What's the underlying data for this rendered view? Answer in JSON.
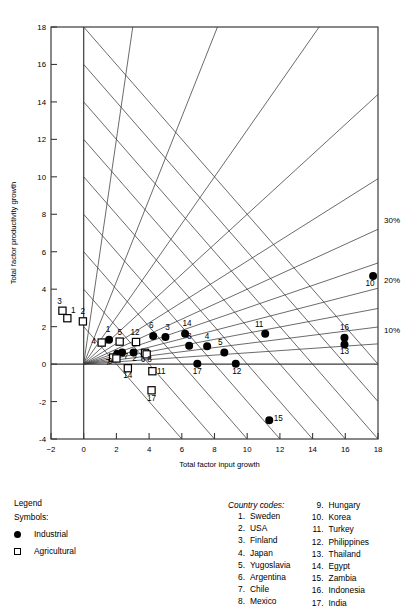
{
  "chart_data": {
    "type": "scatter",
    "title": "",
    "xlabel": "Total factor input growth",
    "ylabel": "Total factor productivity growth",
    "xlim": [
      -2,
      18
    ],
    "ylim": [
      -4,
      18
    ],
    "xticks": [
      -2,
      0,
      2,
      4,
      6,
      8,
      10,
      12,
      14,
      16,
      18
    ],
    "yticks": [
      -4,
      -2,
      0,
      2,
      4,
      6,
      8,
      10,
      12,
      14,
      16,
      18
    ],
    "grid": false,
    "legend_position": "below-left",
    "annotations": [
      "30%",
      "20%",
      "10%"
    ],
    "ray_labels": [
      {
        "label": "30%",
        "x": 18,
        "y": 7.7
      },
      {
        "label": "20%",
        "x": 18,
        "y": 4.5
      },
      {
        "label": "10%",
        "x": 18,
        "y": 1.8
      }
    ],
    "iso_lines_note": "diagonal lines slope -1 from y-axis at even intervals; radial fan lines from origin",
    "series": [
      {
        "name": "Industrial",
        "symbol": "filled-circle",
        "points": [
          {
            "code": "1",
            "country": "Sweden",
            "x": 1.55,
            "y": 1.3
          },
          {
            "code": "2",
            "country": "USA",
            "x": 3.05,
            "y": 0.62
          },
          {
            "code": "3",
            "country": "Finland",
            "x": 5.0,
            "y": 1.45
          },
          {
            "code": "4",
            "country": "Japan",
            "x": 7.55,
            "y": 0.95
          },
          {
            "code": "5",
            "country": "Yugoslavia",
            "x": 8.6,
            "y": 0.62
          },
          {
            "code": "6",
            "country": "Argentina",
            "x": 4.25,
            "y": 1.5
          },
          {
            "code": "7",
            "country": "Chile",
            "x": 2.35,
            "y": 0.62
          },
          {
            "code": "8",
            "country": "Mexico",
            "x": 6.45,
            "y": 0.98
          },
          {
            "code": "9",
            "country": "Hungary",
            "x": 2.05,
            "y": 0.55
          },
          {
            "code": "10",
            "country": "Korea",
            "x": 17.7,
            "y": 4.7
          },
          {
            "code": "11",
            "country": "Turkey",
            "x": 11.1,
            "y": 1.62
          },
          {
            "code": "12",
            "country": "Philippines",
            "x": 9.3,
            "y": 0.02
          },
          {
            "code": "13",
            "country": "Thailand",
            "x": 15.95,
            "y": 1.05
          },
          {
            "code": "14",
            "country": "Egypt",
            "x": 6.2,
            "y": 1.62
          },
          {
            "code": "15",
            "country": "Zambia",
            "x": 11.35,
            "y": -3.0
          },
          {
            "code": "16",
            "country": "Indonesia",
            "x": 15.95,
            "y": 1.4
          },
          {
            "code": "17",
            "country": "India",
            "x": 6.95,
            "y": 0.02
          }
        ]
      },
      {
        "name": "Agricultural",
        "symbol": "open-square",
        "points": [
          {
            "code": "1",
            "country": "Sweden",
            "x": -1.0,
            "y": 2.45
          },
          {
            "code": "2",
            "country": "USA",
            "x": -0.05,
            "y": 2.28
          },
          {
            "code": "3",
            "country": "Finland",
            "x": -1.3,
            "y": 2.85
          },
          {
            "code": "4",
            "country": "Japan",
            "x": 1.1,
            "y": 1.15
          },
          {
            "code": "5",
            "country": "Yugoslavia",
            "x": 2.2,
            "y": 1.2
          },
          {
            "code": "6",
            "country": "Argentina",
            "x": 3.75,
            "y": 0.6
          },
          {
            "code": "7",
            "country": "Chile",
            "x": 1.8,
            "y": 0.35
          },
          {
            "code": "8",
            "country": "Mexico",
            "x": 3.85,
            "y": 0.52
          },
          {
            "code": "9",
            "country": "Hungary",
            "x": 2.0,
            "y": 0.3
          },
          {
            "code": "11",
            "country": "Turkey",
            "x": 4.2,
            "y": -0.38
          },
          {
            "code": "12",
            "country": "Philippines",
            "x": 3.2,
            "y": 1.18
          },
          {
            "code": "14",
            "country": "Egypt",
            "x": 2.7,
            "y": -0.22
          },
          {
            "code": "17",
            "country": "India",
            "x": 4.15,
            "y": -1.4
          }
        ]
      }
    ]
  },
  "legend": {
    "title": "Legend",
    "symbols_label": "Symbols:",
    "entries": [
      {
        "symbol": "filled-circle",
        "label": "Industrial"
      },
      {
        "symbol": "open-square",
        "label": "Agricultural"
      }
    ]
  },
  "country_codes": {
    "title": "Country codes:",
    "column_left": [
      {
        "num": "1.",
        "name": "Sweden"
      },
      {
        "num": "2.",
        "name": "USA"
      },
      {
        "num": "3.",
        "name": "Finland"
      },
      {
        "num": "4.",
        "name": "Japan"
      },
      {
        "num": "5.",
        "name": "Yugoslavia"
      },
      {
        "num": "6.",
        "name": "Argentina"
      },
      {
        "num": "7.",
        "name": "Chile"
      },
      {
        "num": "8.",
        "name": "Mexico"
      }
    ],
    "column_right": [
      {
        "num": "9.",
        "name": "Hungary"
      },
      {
        "num": "10.",
        "name": "Korea"
      },
      {
        "num": "11.",
        "name": "Turkey"
      },
      {
        "num": "12.",
        "name": "Philippines"
      },
      {
        "num": "13.",
        "name": "Thailand"
      },
      {
        "num": "14.",
        "name": "Egypt"
      },
      {
        "num": "15.",
        "name": "Zambia"
      },
      {
        "num": "16.",
        "name": "Indonesia"
      },
      {
        "num": "17.",
        "name": "India"
      }
    ]
  }
}
